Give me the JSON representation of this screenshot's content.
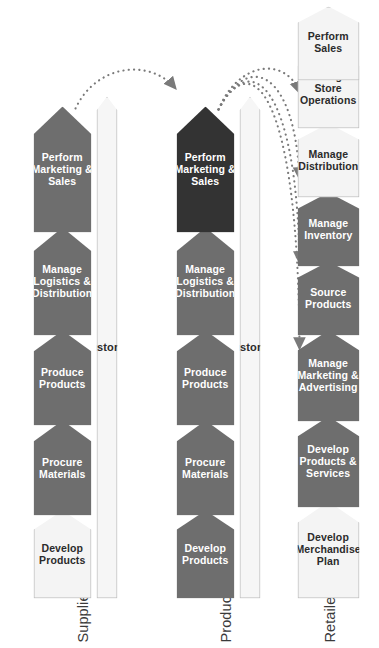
{
  "diagram": {
    "colors": {
      "process_gray": "#6e6e6e",
      "process_highlight": "#333333",
      "process_light": "#f4f4f4",
      "outline": "#b9b9b9",
      "text_on_dark": "#ffffff",
      "text_on_light": "#2b2b2b",
      "flow_arrow": "#7a7a7a"
    },
    "lanes": [
      {
        "id": "supplier",
        "label": "Supplier",
        "support_process": "Manage Customer Service",
        "processes": [
          {
            "label": "Develop\nProducts",
            "style": "light"
          },
          {
            "label": "Procure\nMaterials",
            "style": "gray"
          },
          {
            "label": "Produce\nProducts",
            "style": "gray"
          },
          {
            "label": "Manage\nLogistics &\nDistribution",
            "style": "gray"
          },
          {
            "label": "Perform\nMarketing &\nSales",
            "style": "gray"
          }
        ]
      },
      {
        "id": "producer",
        "label": "Producer",
        "support_process": "Manage Customer Service",
        "processes": [
          {
            "label": "Develop\nProducts",
            "style": "gray"
          },
          {
            "label": "Procure\nMaterials",
            "style": "gray"
          },
          {
            "label": "Produce\nProducts",
            "style": "gray"
          },
          {
            "label": "Manage\nLogistics &\nDistribution",
            "style": "gray"
          },
          {
            "label": "Perform\nMarketing &\nSales",
            "style": "dark"
          }
        ]
      },
      {
        "id": "retailer",
        "label": "Retailer",
        "support_process": "",
        "processes": [
          {
            "label": "Develop\nMerchandise\nPlan",
            "style": "light"
          },
          {
            "label": "Develop\nProducts &\nServices",
            "style": "gray"
          },
          {
            "label": "Manage\nMarketing &\nAdvertising",
            "style": "gray"
          },
          {
            "label": "Source\nProducts",
            "style": "gray"
          },
          {
            "label": "Manage\nInventory",
            "style": "gray"
          },
          {
            "label": "Manage\nDistribution",
            "style": "light"
          },
          {
            "label": "Manage\nStore\nOperations",
            "style": "light"
          },
          {
            "label": "Perform\nSales",
            "style": "light"
          }
        ]
      }
    ],
    "flows": [
      {
        "from": "supplier.perform-marketing-and-sales",
        "to": "producer.procure-materials",
        "style": "dotted-curve"
      },
      {
        "from": "producer.perform-marketing-and-sales",
        "to": "retailer.develop-products-and-services",
        "style": "dotted-curve"
      },
      {
        "from": "producer.perform-marketing-and-sales",
        "to": "retailer.manage-marketing-and-advertising",
        "style": "dotted-curve"
      },
      {
        "from": "producer.perform-marketing-and-sales",
        "to": "retailer.source-products",
        "style": "dotted-curve"
      },
      {
        "from": "producer.perform-marketing-and-sales",
        "to": "retailer.manage-inventory",
        "style": "dotted-curve"
      }
    ]
  }
}
